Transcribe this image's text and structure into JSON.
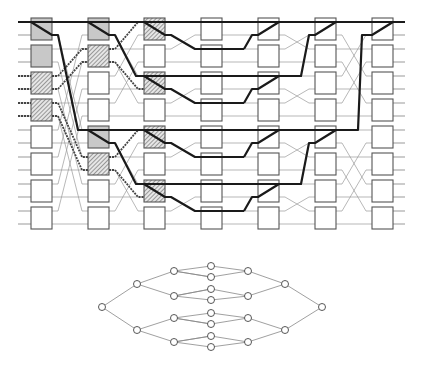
{
  "diagram": {
    "title": "",
    "type": "butterfly-network-with-routing-paths",
    "network": {
      "columns_x": [
        31,
        88,
        144,
        201,
        258,
        315,
        372
      ],
      "rows_y": [
        18,
        45,
        72,
        99,
        126,
        153,
        180,
        207
      ],
      "box_size": [
        21,
        22
      ],
      "wire_offsets": [
        4,
        17
      ],
      "wire_left_x": 18,
      "wire_right_x": 405,
      "colors": {
        "box_stroke": "#555555",
        "box_fill": "#ffffff",
        "box_gray": "#c8c8c8",
        "hatched": "#777777",
        "thin_wire": "#999999",
        "dotted_wire": "#444444",
        "bold_path": "#1a1a1a"
      },
      "gray_boxes": [
        [
          0,
          0
        ],
        [
          0,
          1
        ],
        [
          1,
          0
        ],
        [
          1,
          4
        ]
      ],
      "hatched_boxes": [
        [
          0,
          2
        ],
        [
          0,
          3
        ],
        [
          1,
          1
        ],
        [
          1,
          5
        ],
        [
          2,
          0
        ],
        [
          2,
          2
        ],
        [
          2,
          4
        ],
        [
          2,
          6
        ]
      ],
      "legend": []
    },
    "tree": {
      "description": "Binary tree graph, mirrored left-right, 4 levels",
      "node_radius": 3.5,
      "node_color": "#ffffff",
      "edge_color": "#888888"
    }
  }
}
